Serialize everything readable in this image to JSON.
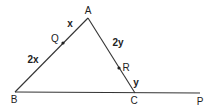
{
  "diagram": {
    "type": "geometry-triangle",
    "stroke_color": "#333333",
    "points": {
      "A": {
        "label": "A",
        "x": 88,
        "y": 18,
        "lx": 88,
        "ly": 14
      },
      "B": {
        "label": "B",
        "x": 15,
        "y": 92,
        "lx": 14,
        "ly": 103
      },
      "C": {
        "label": "C",
        "x": 135,
        "y": 93,
        "lx": 134,
        "ly": 104
      },
      "P": {
        "label": "P",
        "x": 200,
        "y": 93,
        "lx": 200,
        "ly": 105
      },
      "Q": {
        "label": "Q",
        "x": 63,
        "y": 43,
        "lx": 55,
        "ly": 42
      },
      "R": {
        "label": "R",
        "x": 119,
        "y": 68,
        "lx": 126,
        "ly": 71
      }
    },
    "segment_labels": {
      "AQ": {
        "text": "x",
        "x": 70,
        "y": 27
      },
      "QB": {
        "text": "2x",
        "x": 33,
        "y": 63
      },
      "AR": {
        "text": "2y",
        "x": 118,
        "y": 46
      },
      "RC": {
        "text": "y",
        "x": 136,
        "y": 86
      }
    }
  }
}
